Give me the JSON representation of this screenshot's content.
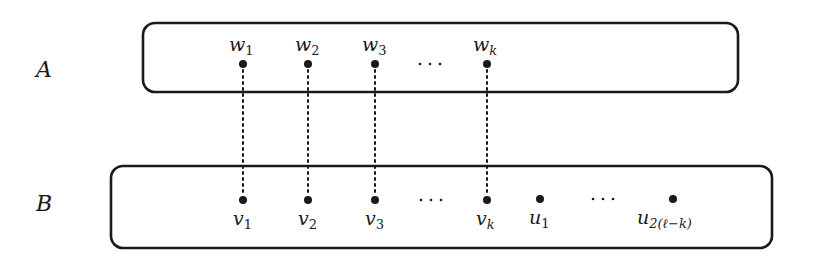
{
  "diagram": {
    "sets": [
      {
        "id": "A",
        "label": "A",
        "box": {
          "x": 143,
          "y": 23,
          "w": 595,
          "h": 69,
          "r": 12
        },
        "label_pos": {
          "x": 36,
          "y": 77
        }
      },
      {
        "id": "B",
        "label": "B",
        "box": {
          "x": 111,
          "y": 166,
          "w": 661,
          "h": 82,
          "r": 12
        },
        "label_pos": {
          "x": 36,
          "y": 211
        }
      }
    ],
    "vertices_A": [
      {
        "name": "w",
        "sub": "1",
        "x": 243,
        "y": 64
      },
      {
        "name": "w",
        "sub": "2",
        "x": 308,
        "y": 64
      },
      {
        "name": "w",
        "sub": "3",
        "x": 375,
        "y": 64
      },
      {
        "name": "w",
        "sub": "k",
        "x": 487,
        "y": 64
      }
    ],
    "vertices_B": [
      {
        "name": "v",
        "sub": "1",
        "x": 243,
        "y": 200
      },
      {
        "name": "v",
        "sub": "2",
        "x": 308,
        "y": 200
      },
      {
        "name": "v",
        "sub": "3",
        "x": 375,
        "y": 200
      },
      {
        "name": "v",
        "sub": "k",
        "x": 487,
        "y": 200
      },
      {
        "name": "u",
        "sub": "1",
        "x": 540,
        "y": 200
      },
      {
        "name": "u",
        "sub": "2(ℓ−k)",
        "x": 673,
        "y": 200
      }
    ],
    "ellipses": [
      {
        "text": "· · ·",
        "x": 430,
        "y": 64
      },
      {
        "text": "· · ·",
        "x": 431,
        "y": 200
      },
      {
        "text": "· · ·",
        "x": 603,
        "y": 200
      }
    ],
    "edges": [
      {
        "from": "w1",
        "to": "v1",
        "style": "dotted"
      },
      {
        "from": "w2",
        "to": "v2",
        "style": "dotted"
      },
      {
        "from": "w3",
        "to": "v3",
        "style": "dotted"
      },
      {
        "from": "wk",
        "to": "vk",
        "style": "dotted"
      }
    ],
    "labels": {
      "set_a": "A",
      "set_b": "B",
      "w1": "w",
      "w1_sub": "1",
      "w2": "w",
      "w2_sub": "2",
      "w3": "w",
      "w3_sub": "3",
      "wk": "w",
      "wk_sub": "k",
      "v1": "v",
      "v1_sub": "1",
      "v2": "v",
      "v2_sub": "2",
      "v3": "v",
      "v3_sub": "3",
      "vk": "v",
      "vk_sub": "k",
      "u1": "u",
      "u1_sub": "1",
      "ulast": "u",
      "ulast_sub": "2(ℓ−k)",
      "ellipsis": "· · ·"
    }
  }
}
